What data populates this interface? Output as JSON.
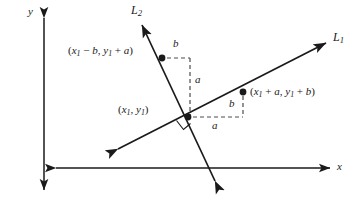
{
  "figure": {
    "type": "geometry-diagram",
    "background_color": "#ffffff",
    "stroke_color": "#1a1a1a",
    "dash_color": "#555555"
  },
  "axes": {
    "x_label": "x",
    "y_label": "y",
    "x_axis": {
      "x1": 56,
      "y1": 168,
      "x2": 330,
      "y2": 168
    },
    "y_axis": {
      "x1": 44,
      "y1": 18,
      "x2": 44,
      "y2": 190
    },
    "x_label_pos": {
      "x": 337,
      "y": 166
    },
    "y_label_pos": {
      "x": 30,
      "y": 12
    },
    "double_headed": true
  },
  "lines": [
    {
      "name": "L1",
      "label": "L",
      "subscript": "1",
      "label_pos": {
        "x": 333,
        "y": 33
      },
      "from": {
        "x": 118,
        "y": 149
      },
      "to": {
        "x": 326,
        "y": 43
      },
      "double_headed": true
    },
    {
      "name": "L2",
      "label": "L",
      "subscript": "2",
      "label_pos": {
        "x": 131,
        "y": 5
      },
      "from": {
        "x": 215,
        "y": 181
      },
      "to": {
        "x": 142,
        "y": 25
      },
      "double_headed": true
    }
  ],
  "points": [
    {
      "name": "intersection-point",
      "label": "(x<sub>1</sub>, y<sub>1</sub>)",
      "label_text": "(x1, y1)",
      "x": 188,
      "y": 117,
      "label_pos": {
        "x": 118,
        "y": 108
      },
      "has_right_angle_marker": true
    },
    {
      "name": "point-on-L2",
      "label_text": "(x1 - b, y1 + a)",
      "x": 162,
      "y": 58,
      "label_pos": {
        "x": 68,
        "y": 50
      }
    },
    {
      "name": "point-on-L1",
      "label_text": "(x1 + a, y1 + b)",
      "x": 243,
      "y": 92,
      "label_pos": {
        "x": 250,
        "y": 90
      }
    }
  ],
  "dashed_paths": {
    "l2_triangle": {
      "horizontal": {
        "x1": 166,
        "y1": 58,
        "x2": 190,
        "y2": 58,
        "label": "b",
        "label_pos": {
          "x": 173,
          "y": 42
        }
      },
      "vertical": {
        "x1": 190,
        "y1": 58,
        "x2": 190,
        "y2": 117,
        "label": "a",
        "label_pos": {
          "x": 196,
          "y": 79
        }
      }
    },
    "l1_triangle": {
      "vertical": {
        "x1": 243,
        "y1": 96,
        "x2": 243,
        "y2": 117,
        "label": "b",
        "label_pos": {
          "x": 230,
          "y": 97
        }
      },
      "horizontal": {
        "x1": 192,
        "y1": 117,
        "x2": 243,
        "y2": 117,
        "label": "a",
        "label_pos": {
          "x": 213,
          "y": 120
        }
      }
    }
  },
  "dimension_labels": [
    {
      "name": "dim-b-upper",
      "text": "b"
    },
    {
      "name": "dim-a-vertical",
      "text": "a"
    },
    {
      "name": "dim-b-lower",
      "text": "b"
    },
    {
      "name": "dim-a-horizontal",
      "text": "a"
    }
  ]
}
